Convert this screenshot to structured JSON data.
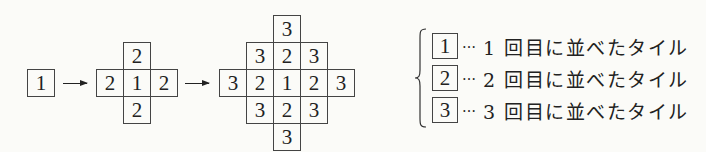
{
  "diagram": {
    "stages": [
      {
        "name": "stage-1",
        "cells": [
          {
            "value": "1",
            "x": 27,
            "y": 69
          }
        ]
      },
      {
        "name": "stage-2",
        "cells": [
          {
            "value": "2",
            "x": 123,
            "y": 42
          },
          {
            "value": "2",
            "x": 96,
            "y": 69
          },
          {
            "value": "1",
            "x": 123,
            "y": 69
          },
          {
            "value": "2",
            "x": 150,
            "y": 69
          },
          {
            "value": "2",
            "x": 123,
            "y": 96
          }
        ]
      },
      {
        "name": "stage-3",
        "cells": [
          {
            "value": "3",
            "x": 273,
            "y": 15
          },
          {
            "value": "3",
            "x": 246,
            "y": 42
          },
          {
            "value": "2",
            "x": 273,
            "y": 42
          },
          {
            "value": "3",
            "x": 300,
            "y": 42
          },
          {
            "value": "3",
            "x": 219,
            "y": 69
          },
          {
            "value": "2",
            "x": 246,
            "y": 69
          },
          {
            "value": "1",
            "x": 273,
            "y": 69
          },
          {
            "value": "2",
            "x": 300,
            "y": 69
          },
          {
            "value": "3",
            "x": 327,
            "y": 69
          },
          {
            "value": "3",
            "x": 246,
            "y": 96
          },
          {
            "value": "2",
            "x": 273,
            "y": 96
          },
          {
            "value": "3",
            "x": 300,
            "y": 96
          },
          {
            "value": "3",
            "x": 273,
            "y": 123
          }
        ]
      }
    ],
    "arrows": [
      {
        "from": "stage-1",
        "to": "stage-2"
      },
      {
        "from": "stage-2",
        "to": "stage-3"
      }
    ]
  },
  "legend": {
    "items": [
      {
        "tile": "1",
        "dots": "…",
        "text": "1 回目に並べたタイル"
      },
      {
        "tile": "2",
        "dots": "…",
        "text": "2 回目に並べたタイル"
      },
      {
        "tile": "3",
        "dots": "…",
        "text": "3 回目に並べたタイル"
      }
    ]
  }
}
